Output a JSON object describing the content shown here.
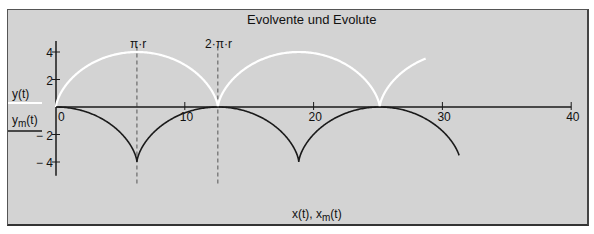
{
  "chart_data": {
    "type": "line",
    "title": "Evolvente und Evolute",
    "xlabel": "x(t), x_m(t)",
    "ylabel_series": [
      "y(t)",
      "y_m(t)"
    ],
    "xlim": [
      0,
      40
    ],
    "ylim": [
      -4,
      4
    ],
    "x_ticks": [
      0,
      10,
      20,
      30,
      40
    ],
    "y_ticks": [
      -4,
      -2,
      2,
      4
    ],
    "r": 2,
    "t_range": [
      0,
      15
    ],
    "markers": [
      {
        "x": 6.283,
        "label": "π·r"
      },
      {
        "x": 12.566,
        "label": "2·π·r"
      }
    ],
    "series": [
      {
        "name": "y(t)",
        "color": "#ffffff",
        "formula": "x=r(t-sin t), y=r(1-cos t)"
      },
      {
        "name": "y_m(t)",
        "color": "#1a1a1a",
        "formula": "x=r(t+sin t), y=r(cos t-1)"
      }
    ],
    "grid": false,
    "legend_position": "left"
  },
  "labels": {
    "title": "Evolvente und Evolute",
    "xaxis": "x(t), x",
    "xaxis_sub": "m",
    "xaxis_tail": "(t)",
    "legend_y": "y(t)",
    "legend_ym": "y",
    "legend_ym_sub": "m",
    "legend_ym_tail": "(t)",
    "marker1": "π·r",
    "marker2": "2·π·r"
  }
}
